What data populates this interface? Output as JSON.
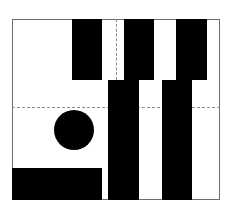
{
  "figure": {
    "colors": {
      "background": "#ffffff",
      "fill": "#000000",
      "frame": "#6e6e6e",
      "guide": "#8a8a8a"
    },
    "frame": {
      "x": 12,
      "y": 19,
      "w": 208,
      "h": 181
    },
    "guides": {
      "vertical": {
        "x": 116,
        "y1": 19,
        "y2": 80
      },
      "horizontal": {
        "y": 107,
        "x1": 12,
        "x2": 220
      }
    },
    "shapes": [
      {
        "id": "top-bar-1",
        "type": "rect",
        "x": 72,
        "y": 19,
        "w": 30,
        "h": 61
      },
      {
        "id": "top-bar-2",
        "type": "rect",
        "x": 124,
        "y": 19,
        "w": 30,
        "h": 61
      },
      {
        "id": "top-bar-3",
        "type": "rect",
        "x": 176,
        "y": 19,
        "w": 31,
        "h": 61
      },
      {
        "id": "lower-bar-1",
        "type": "rect",
        "x": 108,
        "y": 80,
        "w": 31,
        "h": 120
      },
      {
        "id": "lower-bar-2",
        "type": "rect",
        "x": 162,
        "y": 80,
        "w": 30,
        "h": 120
      },
      {
        "id": "bottom-left-block",
        "type": "rect",
        "x": 12,
        "y": 168,
        "w": 90,
        "h": 32
      },
      {
        "id": "circle",
        "type": "circle",
        "cx": 74,
        "cy": 130,
        "r": 20
      }
    ]
  }
}
